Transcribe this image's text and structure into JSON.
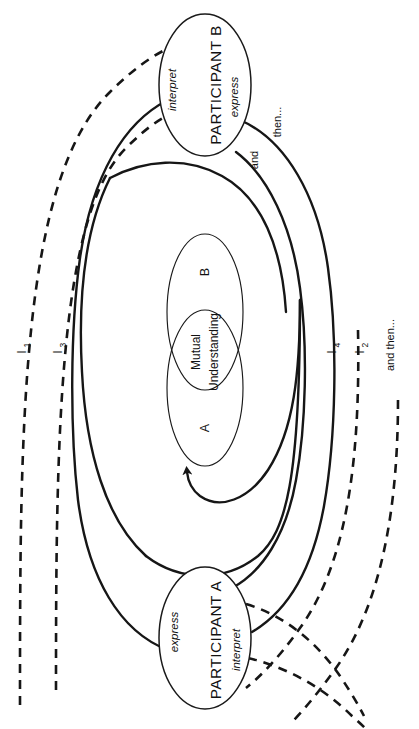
{
  "diagram": {
    "type": "process-diagram",
    "orientation": "rotated-90-ccw",
    "background_color": "#ffffff",
    "line_color": "#161616",
    "nodes": {
      "participant_b": {
        "label": "PARTICIPANT B",
        "role_left": "interpret",
        "role_right": "express"
      },
      "participant_a": {
        "label": "PARTICIPANT A",
        "role_left": "express",
        "role_right": "interpret"
      },
      "center": {
        "set_a": "A",
        "set_b": "B",
        "overlap_line1": "Mutual",
        "overlap_line2": "Understanding"
      }
    },
    "iteration_labels": [
      {
        "id": "I1",
        "base": "I",
        "sub": "1",
        "side": "left",
        "style": "dashed"
      },
      {
        "id": "I3",
        "base": "I",
        "sub": "3",
        "side": "left",
        "style": "dashed"
      },
      {
        "id": "I4",
        "base": "I",
        "sub": "4",
        "side": "right",
        "style": "solid"
      },
      {
        "id": "I2",
        "base": "I",
        "sub": "2",
        "side": "right",
        "style": "dashed"
      }
    ],
    "flow_labels": {
      "and": "and",
      "then": "then...",
      "and_then": "and then..."
    },
    "legend": {
      "solid_meaning": "express",
      "dashed_meaning": "interpret"
    }
  }
}
